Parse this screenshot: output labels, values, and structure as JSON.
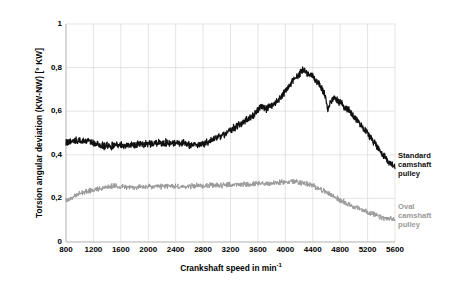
{
  "chart_data": {
    "type": "line",
    "title": "",
    "xlabel": "Crankshaft speed in min",
    "xlabel_sup": "-1",
    "ylabel": "Torsion angular deviation  (KW-NW)  [° KW]",
    "xlim": [
      800,
      5600
    ],
    "ylim": [
      0,
      1
    ],
    "grid": true,
    "legend_position": "right-inline",
    "xticks": [
      "800",
      "1200",
      "1600",
      "2000",
      "2400",
      "2800",
      "3200",
      "3600",
      "4000",
      "4400",
      "4800",
      "5200",
      "5600"
    ],
    "xtick_values": [
      800,
      1200,
      1600,
      2000,
      2400,
      2800,
      3200,
      3600,
      4000,
      4400,
      4800,
      5200,
      5600
    ],
    "yticks": [
      "0",
      "0,2",
      "0,4",
      "0,6",
      "0,8",
      "1"
    ],
    "ytick_values": [
      0,
      0.2,
      0.4,
      0.6,
      0.8,
      1
    ],
    "series": [
      {
        "name": "Standard camshaft pulley",
        "label_lines": "Standard\ncamshaft\npulley",
        "color": "#111111",
        "noise": 0.013,
        "x": [
          800,
          900,
          1000,
          1100,
          1200,
          1300,
          1400,
          1500,
          1600,
          1700,
          1800,
          1900,
          2000,
          2100,
          2200,
          2300,
          2400,
          2500,
          2600,
          2700,
          2800,
          2900,
          3000,
          3100,
          3200,
          3300,
          3400,
          3500,
          3600,
          3650,
          3700,
          3800,
          3900,
          4000,
          4100,
          4200,
          4250,
          4300,
          4400,
          4500,
          4580,
          4620,
          4660,
          4700,
          4800,
          4900,
          5000,
          5100,
          5200,
          5300,
          5400,
          5500,
          5600
        ],
        "values": [
          0.455,
          0.465,
          0.462,
          0.465,
          0.452,
          0.443,
          0.44,
          0.441,
          0.445,
          0.443,
          0.446,
          0.45,
          0.452,
          0.455,
          0.453,
          0.456,
          0.458,
          0.452,
          0.447,
          0.446,
          0.45,
          0.462,
          0.478,
          0.492,
          0.512,
          0.532,
          0.552,
          0.572,
          0.608,
          0.62,
          0.608,
          0.622,
          0.652,
          0.69,
          0.735,
          0.772,
          0.788,
          0.78,
          0.76,
          0.722,
          0.672,
          0.6,
          0.648,
          0.662,
          0.64,
          0.612,
          0.578,
          0.54,
          0.5,
          0.455,
          0.412,
          0.372,
          0.345
        ]
      },
      {
        "name": "Oval camshaft pulley",
        "label_lines": "Oval\ncamshaft\npulley",
        "color": "#9a9a9a",
        "noise": 0.01,
        "x": [
          800,
          900,
          1000,
          1100,
          1200,
          1300,
          1400,
          1500,
          1600,
          1700,
          1800,
          1900,
          2000,
          2100,
          2200,
          2300,
          2400,
          2500,
          2600,
          2700,
          2800,
          2900,
          3000,
          3100,
          3200,
          3300,
          3400,
          3500,
          3600,
          3700,
          3800,
          3900,
          4000,
          4100,
          4200,
          4300,
          4400,
          4500,
          4600,
          4700,
          4800,
          4900,
          5000,
          5100,
          5200,
          5300,
          5400,
          5500,
          5600
        ],
        "values": [
          0.19,
          0.205,
          0.222,
          0.232,
          0.24,
          0.246,
          0.252,
          0.256,
          0.255,
          0.252,
          0.25,
          0.252,
          0.254,
          0.252,
          0.255,
          0.258,
          0.255,
          0.252,
          0.256,
          0.258,
          0.258,
          0.259,
          0.26,
          0.261,
          0.262,
          0.263,
          0.264,
          0.265,
          0.266,
          0.268,
          0.27,
          0.272,
          0.275,
          0.278,
          0.274,
          0.268,
          0.258,
          0.244,
          0.228,
          0.21,
          0.192,
          0.176,
          0.162,
          0.15,
          0.138,
          0.124,
          0.112,
          0.106,
          0.104
        ]
      }
    ]
  },
  "plot_geometry": {
    "left": 66,
    "right": 395,
    "top": 24,
    "bottom": 242
  },
  "colors": {
    "grid": "#d8d8d8",
    "axis": "#bdbdbd",
    "standard": "#111111",
    "oval": "#9a9a9a",
    "background": "#ffffff"
  }
}
